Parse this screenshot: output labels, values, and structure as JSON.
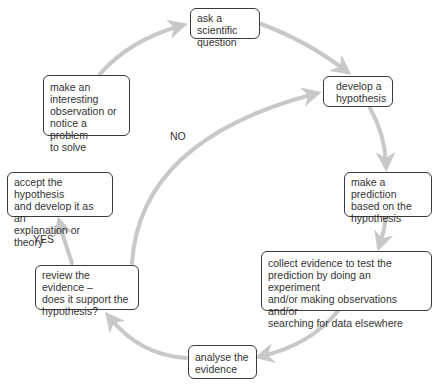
{
  "diagram": {
    "type": "cycle",
    "arrow_color": "#c8c8c8",
    "nodes": [
      {
        "id": "ask",
        "text": "ask a scientific\nquestion"
      },
      {
        "id": "develop",
        "text": "develop a\nhypothesis"
      },
      {
        "id": "predict",
        "text": "make a prediction\nbased on the\nhypothesis"
      },
      {
        "id": "collect",
        "text": "collect evidence to test the\nprediction by doing an experiment\nand/or making observations and/or\nsearching for data elsewhere"
      },
      {
        "id": "analyse",
        "text": "analyse the\nevidence"
      },
      {
        "id": "review",
        "text": "review the evidence –\ndoes it support the\nhypothesis?"
      },
      {
        "id": "accept",
        "text": "accept the hypothesis\nand develop it as an\nexplanation or theory"
      },
      {
        "id": "observe",
        "text": "make an\ninteresting\nobservation or\nnotice a problem\nto solve"
      }
    ],
    "edge_labels": {
      "no": "NO",
      "yes": "YES"
    },
    "edges": [
      {
        "from": "observe",
        "to": "ask"
      },
      {
        "from": "ask",
        "to": "develop"
      },
      {
        "from": "develop",
        "to": "predict"
      },
      {
        "from": "predict",
        "to": "collect"
      },
      {
        "from": "collect",
        "to": "analyse"
      },
      {
        "from": "analyse",
        "to": "review"
      },
      {
        "from": "review",
        "to": "accept",
        "label": "YES"
      },
      {
        "from": "review",
        "to": "develop",
        "label": "NO"
      }
    ]
  }
}
